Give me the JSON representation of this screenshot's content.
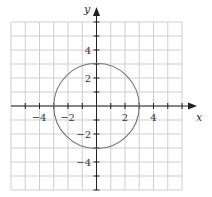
{
  "chart_data": {
    "type": "line",
    "title": "",
    "xlabel": "x",
    "ylabel": "y",
    "xlim": [
      -6,
      6
    ],
    "ylim": [
      -6,
      6
    ],
    "grid": true,
    "grid_step": 1,
    "x_tick_labels": [
      "-4",
      "-2",
      "2",
      "4"
    ],
    "x_tick_values": [
      -4,
      -2,
      2,
      4
    ],
    "y_tick_labels": [
      "4",
      "2",
      "-2",
      "-4"
    ],
    "y_tick_values": [
      4,
      2,
      -2,
      -4
    ],
    "series": [
      {
        "name": "circle",
        "equation": "x^2 + y^2 = 9",
        "center": [
          0,
          0
        ],
        "radius": 3,
        "points": [
          [
            3,
            0
          ],
          [
            0,
            3
          ],
          [
            -3,
            0
          ],
          [
            0,
            -3
          ]
        ],
        "color": "#777777"
      }
    ],
    "legend": null
  },
  "labels": {
    "x_axis": "x",
    "y_axis": "y",
    "x_ticks": [
      "−4",
      "−2",
      "2",
      "4"
    ],
    "y_ticks": [
      "4",
      "2",
      "−2",
      "−4"
    ]
  },
  "colors": {
    "grid": "#cfcfcf",
    "axis": "#222222",
    "curve": "#777777"
  }
}
